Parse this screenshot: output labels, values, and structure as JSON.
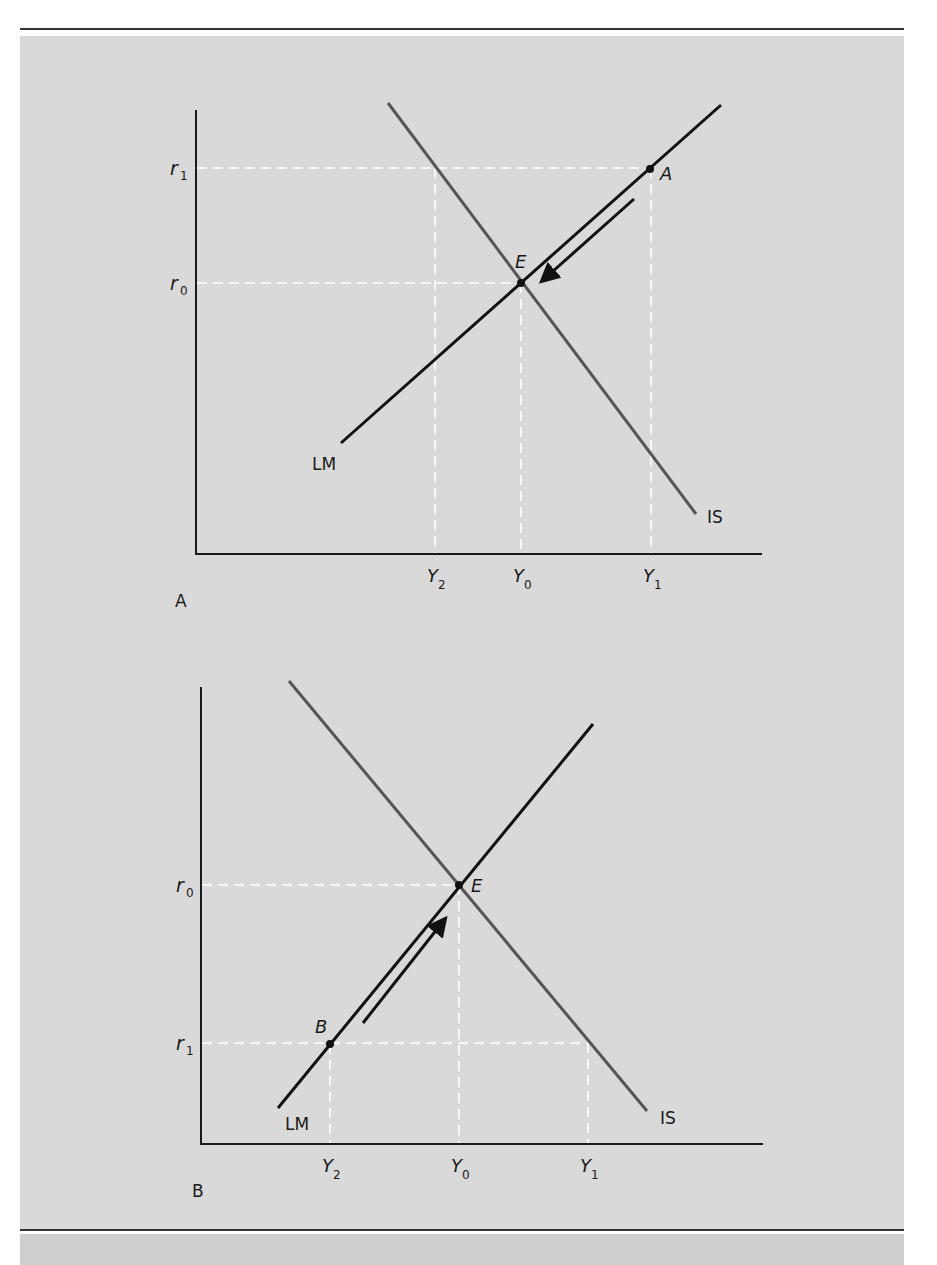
{
  "colors": {
    "background_panel": "#d9d9d9",
    "page": "#ffffff",
    "rule": "#333333",
    "axis": "#1a1a1a",
    "lm_curve": "#111111",
    "is_curve": "#555555",
    "guide": "#ffffff"
  },
  "panels": [
    {
      "id": "A",
      "label": "A",
      "curves": {
        "lm": "LM",
        "is": "IS"
      },
      "points": {
        "equilibrium": "E",
        "disequilibrium": "A"
      },
      "y_ticks": [
        {
          "base": "r",
          "sub": "1"
        },
        {
          "base": "r",
          "sub": "0"
        }
      ],
      "x_ticks": [
        {
          "base": "Y",
          "sub": "2"
        },
        {
          "base": "Y",
          "sub": "0"
        },
        {
          "base": "Y",
          "sub": "1"
        }
      ],
      "arrow_direction": "down-left along LM from A to E"
    },
    {
      "id": "B",
      "label": "B",
      "curves": {
        "lm": "LM",
        "is": "IS"
      },
      "points": {
        "equilibrium": "E",
        "disequilibrium": "B"
      },
      "y_ticks": [
        {
          "base": "r",
          "sub": "0"
        },
        {
          "base": "r",
          "sub": "1"
        }
      ],
      "x_ticks": [
        {
          "base": "Y",
          "sub": "2"
        },
        {
          "base": "Y",
          "sub": "0"
        },
        {
          "base": "Y",
          "sub": "1"
        }
      ],
      "arrow_direction": "up-right along LM from B to E"
    }
  ]
}
